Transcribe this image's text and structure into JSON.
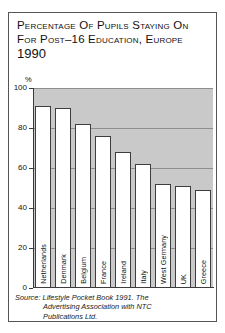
{
  "chart_data": {
    "type": "bar",
    "title_lines": [
      "Percentage Of Pupils Staying On",
      "For Post–16 Education, Europe",
      "1990"
    ],
    "categories": [
      "Netherlands",
      "Denmark",
      "Belgium",
      "France",
      "Ireland",
      "Italy",
      "West Germany",
      "UK",
      "Greece"
    ],
    "values": [
      91,
      90,
      82,
      76,
      68,
      62,
      52,
      51,
      49
    ],
    "xlabel": "",
    "ylabel": "%",
    "ylim": [
      0,
      100
    ],
    "yticks": [
      0,
      20,
      40,
      60,
      80,
      100
    ],
    "ytick_labels": [
      "0",
      "20",
      "40",
      "60",
      "80",
      "100"
    ],
    "grid": true,
    "legend": false,
    "plot_background_color": "#c9c9c9",
    "bar_fill_color": "#ffffff",
    "bar_edge_color": "#3d3d3d",
    "axis_color": "#3a3a3a"
  },
  "source": {
    "label": "Source:",
    "line1": "Lifestyle Pocket Book 1991. The",
    "line2": "Advertising Association with NTC",
    "line3": "Publications Ltd."
  }
}
